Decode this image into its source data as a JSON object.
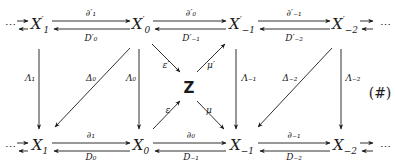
{
  "diagram": {
    "tag": "(#)",
    "ellipsis": "⋯",
    "center": "Z",
    "top_nodes": [
      {
        "base": "X",
        "sup": "′",
        "sub": "1"
      },
      {
        "base": "X",
        "sup": "′",
        "sub": "0"
      },
      {
        "base": "X",
        "sup": "′",
        "sub": "−1"
      },
      {
        "base": "X",
        "sup": "′",
        "sub": "−2"
      }
    ],
    "bottom_nodes": [
      {
        "base": "X",
        "sub": "1"
      },
      {
        "base": "X",
        "sub": "0"
      },
      {
        "base": "X",
        "sub": "−1"
      },
      {
        "base": "X",
        "sub": "−2"
      }
    ],
    "top_forward_labels": [
      "∂′₁",
      "∂′₀",
      "∂′₋₁"
    ],
    "top_backward_labels": [
      "D′₀",
      "D′₋₁",
      "D′₋₂"
    ],
    "bottom_forward_labels": [
      "∂₁",
      "∂₀",
      "∂₋₁"
    ],
    "bottom_backward_labels": [
      "D₀",
      "D₋₁",
      "D₋₂"
    ],
    "vertical_labels": [
      "Λ₁",
      "Λ₀",
      "Λ₋₁",
      "Λ₋₂"
    ],
    "diagonal_labels": [
      "Δ₀",
      "Δ₋₂"
    ],
    "center_labels": {
      "eps_prime": "ε′",
      "mu_prime": "μ′",
      "eps": "ε",
      "mu": "μ"
    }
  }
}
